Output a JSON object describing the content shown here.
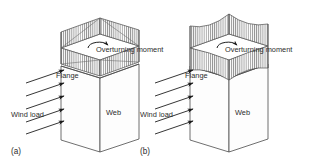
{
  "figure": {
    "type": "technical-diagram",
    "background_color": "#ffffff",
    "line_color": "#3a3a3a",
    "hatch_color": "#555555",
    "face_fill": "#fdfdfd",
    "panels": [
      {
        "id": "a",
        "caption": "(a)",
        "labels": {
          "wind_load": "Wind load",
          "flange": "Flange",
          "web": "Web",
          "moment": "Overturning moment"
        },
        "flange_shape": "straight",
        "wind_arrow_count": 5
      },
      {
        "id": "b",
        "caption": "(b)",
        "labels": {
          "wind_load": "Wind load",
          "flange": "Flange",
          "web": "Web",
          "moment": "Overturning moment"
        },
        "flange_shape": "concave-curved",
        "wind_arrow_count": 5
      }
    ]
  }
}
